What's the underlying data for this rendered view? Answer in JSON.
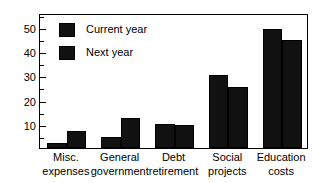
{
  "chart_data": {
    "type": "bar",
    "title": "",
    "subtitle": "",
    "xlabel": "",
    "ylabel": "",
    "ylim": [
      0,
      55.7
    ],
    "yticks": [
      10,
      20,
      30,
      40,
      50
    ],
    "ytick_labels": [
      "10",
      "20",
      "30",
      "40",
      "50"
    ],
    "yminor_ticks": [
      5,
      15,
      25,
      35,
      45,
      55
    ],
    "grid": false,
    "legend_position": "upper left inside",
    "categories": [
      "Misc.\nexpenses",
      "General\ngovernment",
      "Debt\nretirement",
      "Social\nprojects",
      "Education\ncosts"
    ],
    "series": [
      {
        "name": "Current year",
        "color": "#111111",
        "values": [
          2,
          4.5,
          10,
          30,
          49
        ]
      },
      {
        "name": "Next year",
        "color": "#111111",
        "values": [
          7,
          12.5,
          9.7,
          25,
          44.5
        ]
      }
    ]
  }
}
